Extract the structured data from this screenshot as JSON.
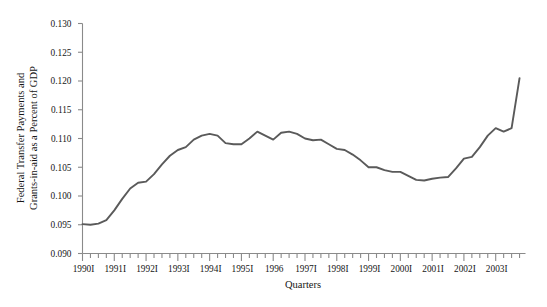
{
  "chart_data": {
    "type": "line",
    "title": "",
    "subtitle": "",
    "xlabel": "Quarters",
    "ylabel": "Federal Transfer Payments and Grants-in-aid as a Percent of GDP",
    "ylabel_line1": "Federal Transfer Payments and",
    "ylabel_line2": "Grants-in-aid as a Percent of GDP",
    "ylim": [
      0.09,
      0.13
    ],
    "ytick_labels": [
      "0.090",
      "0.095",
      "0.100",
      "0.105",
      "0.110",
      "0.115",
      "0.120",
      "0.125",
      "0.130"
    ],
    "ytick_values": [
      0.09,
      0.095,
      0.1,
      0.105,
      0.11,
      0.115,
      0.12,
      0.125,
      0.13
    ],
    "xtick_labels": [
      "1990I",
      "1991I",
      "1992I",
      "1993I",
      "1994I",
      "1995I",
      "1996",
      "1997I",
      "1998I",
      "1999I",
      "2000I",
      "2001I",
      "2002I",
      "2003I"
    ],
    "xlim_start": "1990I",
    "xlim_end": "2003IV",
    "grid": false,
    "legend": "none",
    "line_color": "#5a5a5a",
    "axis_color": "#8a8a8a",
    "x_quarters": [
      "1990I",
      "1990II",
      "1990III",
      "1990IV",
      "1991I",
      "1991II",
      "1991III",
      "1991IV",
      "1992I",
      "1992II",
      "1992III",
      "1992IV",
      "1993I",
      "1993II",
      "1993III",
      "1993IV",
      "1994I",
      "1994II",
      "1994III",
      "1994IV",
      "1995I",
      "1995II",
      "1995III",
      "1995IV",
      "1996I",
      "1996II",
      "1996III",
      "1996IV",
      "1997I",
      "1997II",
      "1997III",
      "1997IV",
      "1998I",
      "1998II",
      "1998III",
      "1998IV",
      "1999I",
      "1999II",
      "1999III",
      "1999IV",
      "2000I",
      "2000II",
      "2000III",
      "2000IV",
      "2001I",
      "2001II",
      "2001III",
      "2001IV",
      "2002I",
      "2002II",
      "2002III",
      "2002IV",
      "2003I",
      "2003II",
      "2003III",
      "2003IV"
    ],
    "values": [
      0.0951,
      0.095,
      0.0952,
      0.0958,
      0.0975,
      0.0995,
      0.1013,
      0.1023,
      0.1025,
      0.1038,
      0.1055,
      0.107,
      0.108,
      0.1085,
      0.1098,
      0.1105,
      0.1108,
      0.1105,
      0.1092,
      0.109,
      0.109,
      0.11,
      0.1112,
      0.1105,
      0.1098,
      0.111,
      0.1112,
      0.1108,
      0.11,
      0.1097,
      0.1098,
      0.109,
      0.1082,
      0.108,
      0.1072,
      0.1062,
      0.105,
      0.105,
      0.1045,
      0.1042,
      0.1042,
      0.1035,
      0.1028,
      0.1027,
      0.103,
      0.1032,
      0.1033,
      0.1048,
      0.1065,
      0.1068,
      0.1085,
      0.1105,
      0.1118,
      0.1112,
      0.1118,
      0.1205
    ]
  }
}
